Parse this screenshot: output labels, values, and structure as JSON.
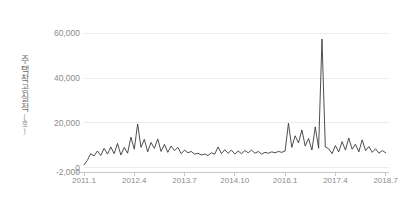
{
  "chart_data": {
    "type": "line",
    "title": "",
    "xlabel": "",
    "ylabel": "주택착공실적",
    "ylabel_unit": "(호)",
    "ylim": [
      -2000,
      66000
    ],
    "xlim": [
      0,
      91
    ],
    "grid": true,
    "legend": "none",
    "line_color": "#3a3a3a",
    "grid_color": "#e6e6e6",
    "axis_color": "#b9b9b9",
    "tick_label_color": "#8c8c8c",
    "yticks": [
      {
        "value": 60000,
        "label": "60,000"
      },
      {
        "value": 40000,
        "label": "40,000"
      },
      {
        "value": 20000,
        "label": "20,000"
      },
      {
        "value": 0,
        "label": "0"
      },
      {
        "value": -2000,
        "label": "-2,000"
      }
    ],
    "xticks": [
      {
        "index": 0,
        "label": "2011.1"
      },
      {
        "index": 15,
        "label": "2012.4"
      },
      {
        "index": 30,
        "label": "2013.7"
      },
      {
        "index": 45,
        "label": "2014.10"
      },
      {
        "index": 60,
        "label": "2016.1"
      },
      {
        "index": 75,
        "label": "2017.4"
      },
      {
        "index": 90,
        "label": "2018.7"
      }
    ],
    "x_start": "2011.1",
    "x_end": "2018.7",
    "x_interval": "monthly",
    "annotations": [
      {
        "text": "peak",
        "index": 71,
        "value": 57500
      }
    ],
    "series": [
      {
        "name": "주택착공실적",
        "color": "#3a3a3a",
        "values": [
          1200,
          3200,
          6200,
          5200,
          7400,
          5400,
          8600,
          6000,
          9200,
          6200,
          10800,
          5600,
          9000,
          6400,
          13600,
          8200,
          19500,
          9000,
          12600,
          7000,
          11200,
          8600,
          12800,
          7200,
          10400,
          6800,
          9600,
          7600,
          9000,
          6200,
          7800,
          6600,
          7200,
          6000,
          6400,
          5600,
          6000,
          5400,
          6600,
          6000,
          9200,
          6200,
          8000,
          6400,
          7800,
          6000,
          7400,
          6200,
          7600,
          6600,
          7800,
          6400,
          7200,
          6000,
          6800,
          6400,
          7000,
          6600,
          7200,
          6800,
          7400,
          19800,
          9000,
          14200,
          11000,
          16800,
          9600,
          13000,
          7800,
          18200,
          8600,
          57500,
          9200,
          8400,
          6200,
          9800,
          7000,
          11600,
          7800,
          13200,
          8200,
          10400,
          7000,
          12400,
          7600,
          9400,
          6800,
          8400,
          6400,
          7600,
          6600
        ]
      }
    ]
  }
}
